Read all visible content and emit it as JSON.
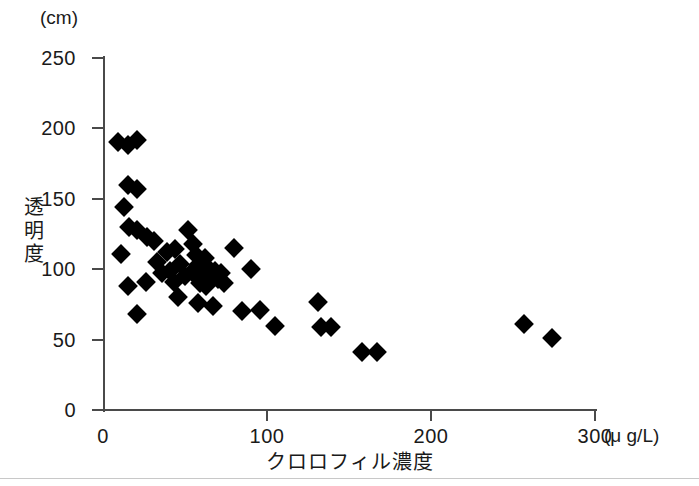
{
  "figure": {
    "background_color": "#ffffff",
    "marker_color": "#000000",
    "axis_color": "#4a4a4a"
  },
  "axes": {
    "y_unit": "(cm)",
    "x_unit": "(μ g/L)",
    "y_title": [
      "透",
      "明",
      "度"
    ],
    "x_title": "クロロフィル濃度"
  },
  "chart_data": {
    "type": "scatter",
    "title": "",
    "xlabel": "クロロフィル濃度",
    "ylabel": "透明度",
    "x_unit": "μg/L",
    "y_unit": "cm",
    "xlim": [
      0,
      300
    ],
    "ylim": [
      0,
      250
    ],
    "xticks": [
      0,
      100,
      200,
      300
    ],
    "yticks": [
      0,
      50,
      100,
      150,
      200,
      250
    ],
    "xtick_labels": [
      "0",
      "100",
      "200",
      "300"
    ],
    "ytick_labels": [
      "0",
      "50",
      "100",
      "150",
      "200",
      "250"
    ],
    "grid": false,
    "legend": false,
    "marker": "filled-diamond",
    "points": [
      [
        9,
        190
      ],
      [
        15,
        188
      ],
      [
        21,
        192
      ],
      [
        15,
        160
      ],
      [
        21,
        157
      ],
      [
        13,
        144
      ],
      [
        16,
        130
      ],
      [
        21,
        128
      ],
      [
        11,
        111
      ],
      [
        15,
        88
      ],
      [
        26,
        91
      ],
      [
        21,
        68
      ],
      [
        27,
        123
      ],
      [
        31,
        120
      ],
      [
        33,
        105
      ],
      [
        36,
        97
      ],
      [
        39,
        112
      ],
      [
        44,
        114
      ],
      [
        41,
        99
      ],
      [
        43,
        91
      ],
      [
        47,
        104
      ],
      [
        50,
        95
      ],
      [
        52,
        128
      ],
      [
        55,
        118
      ],
      [
        57,
        110
      ],
      [
        58,
        103
      ],
      [
        54,
        98
      ],
      [
        60,
        96
      ],
      [
        62,
        108
      ],
      [
        64,
        101
      ],
      [
        66,
        95
      ],
      [
        59,
        90
      ],
      [
        63,
        88
      ],
      [
        68,
        99
      ],
      [
        70,
        93
      ],
      [
        72,
        97
      ],
      [
        74,
        90
      ],
      [
        46,
        80
      ],
      [
        58,
        76
      ],
      [
        67,
        74
      ],
      [
        80,
        115
      ],
      [
        90,
        100
      ],
      [
        85,
        70
      ],
      [
        96,
        71
      ],
      [
        105,
        60
      ],
      [
        131,
        77
      ],
      [
        133,
        59
      ],
      [
        139,
        59
      ],
      [
        158,
        41
      ],
      [
        167,
        41
      ],
      [
        257,
        61
      ],
      [
        274,
        51
      ]
    ]
  }
}
